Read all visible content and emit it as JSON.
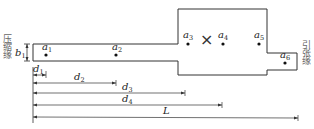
{
  "diagram": {
    "left_edge_label": "压缩缘",
    "right_edge_label": "引张缘",
    "thickness_label": {
      "base": "b",
      "sub": "1"
    },
    "center_marker": "×",
    "points": [
      {
        "base": "a",
        "sub": "1"
      },
      {
        "base": "a",
        "sub": "2"
      },
      {
        "base": "a",
        "sub": "3"
      },
      {
        "base": "a",
        "sub": "4"
      },
      {
        "base": "a",
        "sub": "5"
      },
      {
        "base": "a",
        "sub": "6"
      }
    ],
    "dimensions": [
      {
        "base": "d",
        "sub": "1"
      },
      {
        "base": "d",
        "sub": "2"
      },
      {
        "base": "d",
        "sub": "3"
      },
      {
        "base": "d",
        "sub": "4"
      },
      {
        "base": "L",
        "sub": ""
      }
    ],
    "colors": {
      "stroke": "#333333",
      "text": "#222222",
      "side_text": "#666666"
    }
  }
}
